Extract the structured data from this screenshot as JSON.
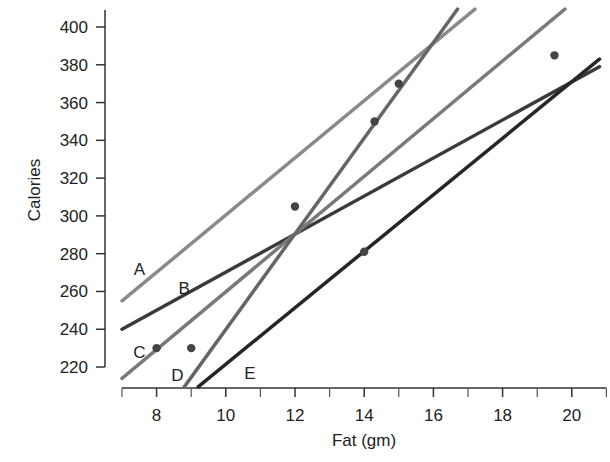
{
  "chart_data": {
    "type": "scatter",
    "title": "",
    "xlabel": "Fat (gm)",
    "ylabel": "Calories",
    "xlim": [
      7,
      21
    ],
    "ylim": [
      210,
      410
    ],
    "xticks": [
      8,
      10,
      12,
      14,
      16,
      18,
      20
    ],
    "xminor_ticks": [
      7,
      9,
      11,
      13,
      15,
      17,
      19,
      21
    ],
    "yticks": [
      220,
      240,
      260,
      280,
      300,
      320,
      340,
      360,
      380,
      400
    ],
    "grid": false,
    "legend": null,
    "points": [
      {
        "x": 8,
        "y": 230
      },
      {
        "x": 9,
        "y": 230
      },
      {
        "x": 12,
        "y": 305
      },
      {
        "x": 14,
        "y": 281
      },
      {
        "x": 14.3,
        "y": 350
      },
      {
        "x": 15,
        "y": 370
      },
      {
        "x": 19.5,
        "y": 385
      }
    ],
    "series": [
      {
        "name": "A",
        "type": "line",
        "x": [
          7,
          17.2
        ],
        "y": [
          255,
          409.5
        ],
        "color": "#8a8a8a"
      },
      {
        "name": "B",
        "type": "line",
        "x": [
          7,
          20.8
        ],
        "y": [
          240,
          379
        ],
        "color": "#3a3a3a"
      },
      {
        "name": "C",
        "type": "line",
        "x": [
          7,
          19.8
        ],
        "y": [
          214,
          409.5
        ],
        "color": "#7a7a7a"
      },
      {
        "name": "D",
        "type": "line",
        "x": [
          8.8,
          16.7
        ],
        "y": [
          209.5,
          409.5
        ],
        "color": "#666666"
      },
      {
        "name": "E",
        "type": "line",
        "x": [
          9.2,
          20.8
        ],
        "y": [
          209.5,
          383
        ],
        "color": "#262626"
      }
    ],
    "annotations": [
      {
        "text": "A",
        "x": 7.5,
        "y": 272
      },
      {
        "text": "B",
        "x": 8.8,
        "y": 262
      },
      {
        "text": "C",
        "x": 7.5,
        "y": 228
      },
      {
        "text": "D",
        "x": 8.6,
        "y": 216
      },
      {
        "text": "E",
        "x": 10.7,
        "y": 217
      }
    ]
  }
}
